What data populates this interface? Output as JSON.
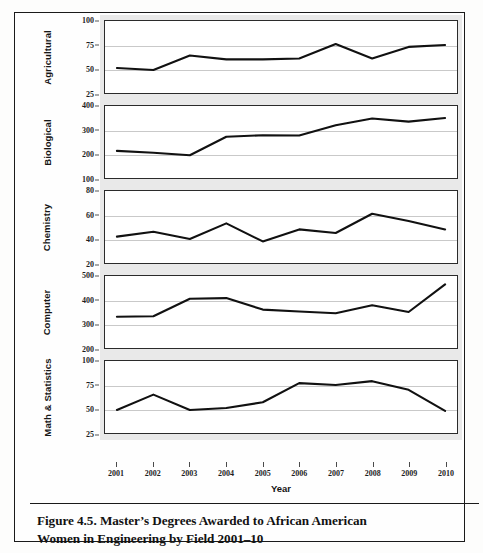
{
  "figure": {
    "caption_line_1": "Figure 4.5. Master’s Degrees Awarded to African American",
    "caption_line_2": "Women in Engineering by Field 2001–10"
  },
  "chart_data": {
    "type": "line",
    "title": "Master’s Degrees Awarded to African American Women in Engineering by Field 2001–10",
    "xlabel": "Year",
    "ylabel": "",
    "grid": true,
    "legend": "none",
    "layout": "small-multiples-vertical-strip",
    "x": [
      2001,
      2002,
      2003,
      2004,
      2005,
      2006,
      2007,
      2008,
      2009,
      2010
    ],
    "categories": [
      "2001",
      "2002",
      "2003",
      "2004",
      "2005",
      "2006",
      "2007",
      "2008",
      "2009",
      "2010"
    ],
    "panels": [
      {
        "name": "Agricultural",
        "ylim": [
          25,
          100
        ],
        "yticks": [
          25,
          50,
          75,
          100
        ],
        "ytick_labels": [
          "25",
          "50",
          "75",
          "100"
        ],
        "values": [
          51,
          49,
          64,
          60,
          60,
          61,
          76,
          61,
          73,
          75
        ]
      },
      {
        "name": "Biological",
        "ylim": [
          100,
          400
        ],
        "yticks": [
          100,
          200,
          300,
          400
        ],
        "ytick_labels": [
          "100",
          "200",
          "300",
          "400"
        ],
        "values": [
          213,
          205,
          195,
          272,
          278,
          277,
          320,
          348,
          335,
          350
        ]
      },
      {
        "name": "Chemistry",
        "ylim": [
          20,
          80
        ],
        "yticks": [
          20,
          40,
          60,
          80
        ],
        "ytick_labels": [
          "20",
          "40",
          "60",
          "80"
        ],
        "values": [
          42,
          46,
          40,
          53,
          38,
          48,
          45,
          61,
          55,
          48
        ]
      },
      {
        "name": "Computer",
        "ylim": [
          200,
          500
        ],
        "yticks": [
          200,
          300,
          400,
          500
        ],
        "ytick_labels": [
          "200",
          "300",
          "400",
          "500"
        ],
        "values": [
          330,
          332,
          405,
          408,
          360,
          352,
          345,
          378,
          350,
          465
        ]
      },
      {
        "name": "Math & Statistics",
        "ylim": [
          25,
          100
        ],
        "yticks": [
          25,
          50,
          75,
          100
        ],
        "ytick_labels": [
          "25",
          "50",
          "75",
          "100"
        ],
        "values": [
          49,
          65,
          49,
          51,
          57,
          77,
          75,
          79,
          70,
          48
        ]
      }
    ],
    "colors": {
      "line": "#111111",
      "grid": "#c9c9c9",
      "panel_background": "#ffffff",
      "strip_background": "#e9e9e9",
      "axis": "#2b2b2b"
    }
  }
}
